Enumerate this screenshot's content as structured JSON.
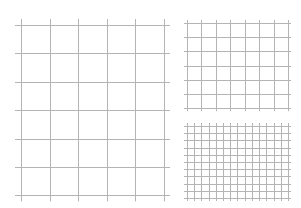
{
  "page": {
    "background": "#ffffff",
    "line_color": "#b4b4b4"
  },
  "grids": [
    {
      "name": "large-grid",
      "x": 21,
      "y": 25,
      "cols": 5,
      "rows": 6,
      "cell_w": 28.6,
      "cell_h": 28.4,
      "overhang": 6
    },
    {
      "name": "medium-grid",
      "x": 187,
      "y": 23,
      "cols": 7,
      "rows": 6,
      "cell_w": 14.43,
      "cell_h": 14.2,
      "overhang": 3
    },
    {
      "name": "small-grid",
      "x": 187,
      "y": 126,
      "cols": 14,
      "rows": 10,
      "cell_w": 7.21,
      "cell_h": 7.2,
      "overhang": 3
    }
  ]
}
